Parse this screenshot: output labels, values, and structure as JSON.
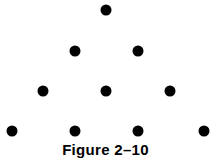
{
  "figure": {
    "caption": "Figure 2–10",
    "dot_color": "#000000",
    "rows": [
      {
        "count": 1,
        "dots": [
          {
            "x": 106,
            "y": 10
          }
        ]
      },
      {
        "count": 2,
        "dots": [
          {
            "x": 75,
            "y": 51
          },
          {
            "x": 138,
            "y": 51
          }
        ]
      },
      {
        "count": 3,
        "dots": [
          {
            "x": 43,
            "y": 91
          },
          {
            "x": 106,
            "y": 91
          },
          {
            "x": 170,
            "y": 91
          }
        ]
      },
      {
        "count": 4,
        "dots": [
          {
            "x": 12,
            "y": 131
          },
          {
            "x": 75,
            "y": 131
          },
          {
            "x": 138,
            "y": 131
          },
          {
            "x": 204,
            "y": 131
          }
        ]
      }
    ]
  }
}
